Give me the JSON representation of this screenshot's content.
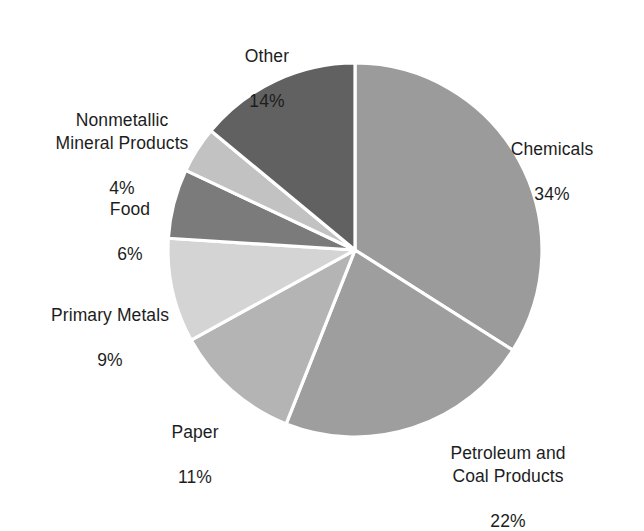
{
  "chart_data": {
    "type": "pie",
    "title": "",
    "subtitle": "",
    "xlabel": "",
    "ylabel": "",
    "legend_position": "none",
    "grid": false,
    "start_angle_deg": 0,
    "direction": "clockwise",
    "categories": [
      "Chemicals",
      "Petroleum and Coal Products",
      "Paper",
      "Primary Metals",
      "Food",
      "Nonmetallic Mineral Products",
      "Other"
    ],
    "values": [
      34,
      22,
      11,
      9,
      6,
      4,
      14
    ],
    "value_unit": "%",
    "slices": [
      {
        "label": "Chemicals",
        "label_lines": "Chemicals",
        "value": 34,
        "value_text": "34%",
        "color": "#9b9b9b"
      },
      {
        "label": "Petroleum and Coal Products",
        "label_lines": "Petroleum and\nCoal Products",
        "value": 22,
        "value_text": "22%",
        "color": "#9e9e9e"
      },
      {
        "label": "Paper",
        "label_lines": "Paper",
        "value": 11,
        "value_text": "11%",
        "color": "#b4b4b4"
      },
      {
        "label": "Primary Metals",
        "label_lines": "Primary Metals",
        "value": 9,
        "value_text": "9%",
        "color": "#d4d4d4"
      },
      {
        "label": "Food",
        "label_lines": "Food",
        "value": 6,
        "value_text": "6%",
        "color": "#7b7b7b"
      },
      {
        "label": "Nonmetallic Mineral Products",
        "label_lines": "Nonmetallic\nMineral Products",
        "value": 4,
        "value_text": "4%",
        "color": "#c2c2c2"
      },
      {
        "label": "Other",
        "label_lines": "Other",
        "value": 14,
        "value_text": "14%",
        "color": "#616161"
      }
    ],
    "background_color": "#ffffff",
    "slice_border_color": "#ffffff",
    "text_color": "#1d1d1d"
  }
}
